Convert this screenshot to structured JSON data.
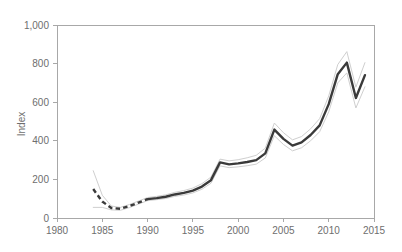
{
  "chart_data": {
    "type": "line",
    "title": "",
    "subtitle": "",
    "xlabel": "",
    "ylabel": "Index",
    "xlim": [
      1980,
      2015
    ],
    "ylim": [
      0,
      1000
    ],
    "grid": false,
    "legend": "none",
    "x_ticks": [
      "1980",
      "1985",
      "1990",
      "1995",
      "2000",
      "2005",
      "2010",
      "2015"
    ],
    "x_tick_values": [
      1980,
      1985,
      1990,
      1995,
      2000,
      2005,
      2010,
      2015
    ],
    "y_ticks": [
      "0",
      "200",
      "400",
      "600",
      "800",
      "1,000"
    ],
    "y_tick_values": [
      0,
      200,
      400,
      600,
      800,
      1000
    ],
    "x": [
      1984,
      1985,
      1986,
      1987,
      1988,
      1989,
      1990,
      1991,
      1992,
      1993,
      1994,
      1995,
      1996,
      1997,
      1998,
      1999,
      2000,
      2001,
      2002,
      2003,
      2004,
      2005,
      2006,
      2007,
      2008,
      2009,
      2010,
      2011,
      2012,
      2013,
      2014
    ],
    "series": [
      {
        "name": "Index",
        "style": "line",
        "dashed_range": [
          1984,
          1990
        ],
        "values": [
          150,
          85,
          52,
          48,
          62,
          80,
          98,
          103,
          110,
          122,
          130,
          142,
          163,
          196,
          288,
          278,
          283,
          290,
          300,
          335,
          458,
          410,
          375,
          392,
          430,
          480,
          590,
          745,
          805,
          622,
          740
        ]
      },
      {
        "name": "Upper bound",
        "style": "thin-line",
        "values": [
          245,
          118,
          62,
          55,
          70,
          88,
          106,
          112,
          120,
          133,
          142,
          155,
          178,
          212,
          305,
          296,
          302,
          312,
          325,
          362,
          492,
          442,
          405,
          422,
          462,
          515,
          632,
          795,
          862,
          678,
          805
        ]
      },
      {
        "name": "Lower bound",
        "style": "thin-line",
        "values": [
          55,
          55,
          42,
          40,
          54,
          72,
          90,
          95,
          101,
          112,
          119,
          130,
          149,
          180,
          270,
          261,
          265,
          271,
          279,
          311,
          426,
          381,
          348,
          364,
          400,
          447,
          550,
          700,
          752,
          570,
          680
        ]
      }
    ]
  },
  "axis": {
    "y_title": "Index"
  }
}
